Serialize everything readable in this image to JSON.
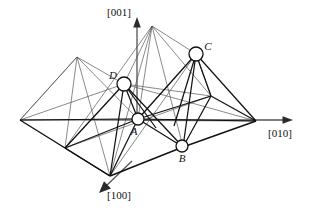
{
  "figure": {
    "background": "#ffffff",
    "line_color": "#1a1a1a",
    "thin_line_color": "#555555",
    "axis_color": "#4d4d4d",
    "atom_fill": "#ffffff",
    "atom_stroke": "#111111"
  },
  "axes": [
    {
      "id": "axis-001",
      "label": "[001]",
      "label_x": 108,
      "label_y": 14,
      "dir": "up"
    },
    {
      "id": "axis-010",
      "label": "[010]",
      "label_x": 265,
      "label_y": 136,
      "dir": "right"
    },
    {
      "id": "axis-100",
      "label": "[100]",
      "label_x": 104,
      "label_y": 199,
      "dir": "down-left"
    }
  ],
  "atoms": [
    {
      "id": "atom-A",
      "label": "A",
      "cx": 138,
      "cy": 119,
      "r": 6,
      "label_x": 134,
      "label_y": 135
    },
    {
      "id": "atom-B",
      "label": "B",
      "cx": 182,
      "cy": 146,
      "r": 6,
      "label_x": 179,
      "label_y": 162
    },
    {
      "id": "atom-C",
      "label": "C",
      "cx": 196,
      "cy": 54,
      "r": 7,
      "label_x": 205,
      "label_y": 50
    },
    {
      "id": "atom-D",
      "label": "D",
      "cx": 124,
      "cy": 84,
      "r": 7,
      "label_x": 112,
      "label_y": 79
    }
  ],
  "geometry": {
    "base_vertices": {
      "left": [
        20,
        120
      ],
      "bottom": [
        110,
        176
      ],
      "right": [
        256,
        121
      ],
      "mid_left": [
        65,
        148
      ],
      "mid_front": [
        183,
        147
      ],
      "mid_back": [
        138,
        119
      ],
      "mid_right": [
        211,
        96
      ]
    },
    "apexes": {
      "left_apex": [
        77,
        57
      ],
      "center_apex": [
        152,
        26
      ],
      "node_C": [
        196,
        54
      ],
      "node_D": [
        124,
        84
      ]
    }
  },
  "caption": ""
}
